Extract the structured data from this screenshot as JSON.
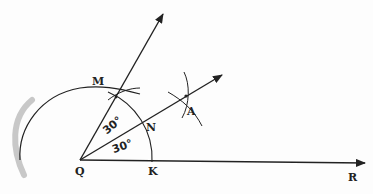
{
  "diagram": {
    "points": {
      "Q": {
        "label": "Q",
        "x": 80,
        "y": 160
      },
      "K": {
        "label": "K",
        "x": 152,
        "y": 161
      },
      "R": {
        "label": "R",
        "x": 365,
        "y": 163
      },
      "M": {
        "label": "M",
        "x": 116,
        "y": 96
      },
      "N": {
        "label": "N",
        "x": 143,
        "y": 126
      },
      "A": {
        "label": "A",
        "x": 184,
        "y": 96
      }
    },
    "angles": {
      "upper": "30°",
      "lower": "30°"
    },
    "colors": {
      "ink": "#222222",
      "shadow": "#c8c8c8"
    }
  }
}
